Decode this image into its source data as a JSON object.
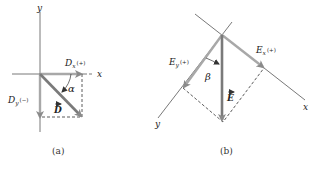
{
  "colors": {
    "axis": "#555555",
    "vector": "#8a8a8a",
    "component": "#a8a8a8",
    "dashed": "#333333",
    "text": "#222222"
  },
  "panel_a": {
    "caption": "(a)",
    "axis_x": "x",
    "axis_y": "y",
    "vector": "D",
    "component_x": "D",
    "component_x_sub": "x",
    "component_x_sign": "(+)",
    "component_y": "D",
    "component_y_sub": "y",
    "component_y_sign": "(−)",
    "angle": "α"
  },
  "panel_b": {
    "caption": "(b)",
    "axis_x": "x",
    "axis_y": "y",
    "vector": "E",
    "component_x": "E",
    "component_x_sub": "x",
    "component_x_sign": "(+)",
    "component_y": "E",
    "component_y_sub": "y",
    "component_y_sign": "(+)",
    "angle": "β"
  }
}
